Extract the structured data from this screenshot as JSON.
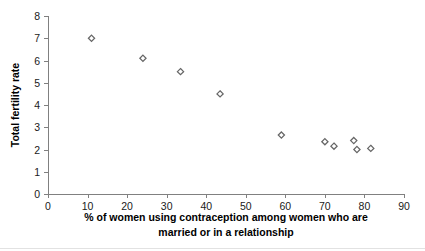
{
  "chart_data": {
    "type": "scatter",
    "title": "",
    "xlabel": "% of women using contraception among women who are married or in a relationship",
    "xlabel_line1": "% of women using contraception among women who are",
    "xlabel_line2": "married or in a relationship",
    "ylabel": "Total fertility rate",
    "xlim": [
      0,
      90
    ],
    "ylim": [
      0,
      8
    ],
    "xticks": [
      0,
      10,
      20,
      30,
      40,
      50,
      60,
      70,
      80,
      90
    ],
    "yticks": [
      0,
      1,
      2,
      3,
      4,
      5,
      6,
      7,
      8
    ],
    "xtick_labels": [
      "0",
      "10",
      "20",
      "30",
      "40",
      "50",
      "60",
      "70",
      "80",
      "90"
    ],
    "ytick_labels": [
      "0",
      "1",
      "2",
      "3",
      "4",
      "5",
      "6",
      "7",
      "8"
    ],
    "grid": false,
    "legend": null,
    "marker": "open-diamond",
    "marker_color": "#666666",
    "points": [
      {
        "x": 11.0,
        "y": 7.0
      },
      {
        "x": 24.0,
        "y": 6.1
      },
      {
        "x": 33.5,
        "y": 5.5
      },
      {
        "x": 43.5,
        "y": 4.5
      },
      {
        "x": 59.0,
        "y": 2.65
      },
      {
        "x": 70.0,
        "y": 2.35
      },
      {
        "x": 72.3,
        "y": 2.15
      },
      {
        "x": 77.3,
        "y": 2.4
      },
      {
        "x": 78.1,
        "y": 2.0
      },
      {
        "x": 81.6,
        "y": 2.05
      }
    ]
  }
}
